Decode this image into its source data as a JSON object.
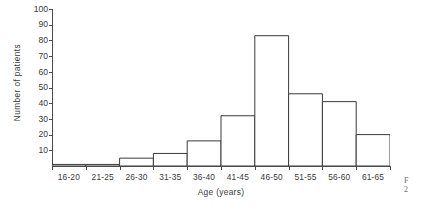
{
  "chart_data": {
    "type": "bar",
    "title": "",
    "subtitle": "",
    "xlabel": "Age (years)",
    "ylabel": "Number of patients",
    "categories": [
      "16-20",
      "21-25",
      "26-30",
      "31-35",
      "36-40",
      "41-45",
      "46-50",
      "51-55",
      "56-60",
      "61-65"
    ],
    "values": [
      1,
      1,
      5,
      8,
      16,
      32,
      83,
      46,
      41,
      20
    ],
    "series": [
      {
        "name": "Number of patients",
        "values": [
          1,
          1,
          5,
          8,
          16,
          32,
          83,
          46,
          41,
          20
        ]
      }
    ],
    "ylim": [
      0,
      100
    ],
    "ytick_values": [
      10,
      20,
      30,
      40,
      50,
      60,
      70,
      80,
      90,
      100
    ],
    "ytick_labels": [
      "10",
      "20",
      "30",
      "40",
      "50",
      "60",
      "70",
      "80",
      "90",
      "100"
    ],
    "xtick_labels": [
      "16-20",
      "21-25",
      "26-30",
      "31-35",
      "36-40",
      "41-45",
      "46-50",
      "51-55",
      "56-60",
      "61-65"
    ],
    "grid": false,
    "legend": false,
    "legend_position": "none",
    "bar_style": "outlined",
    "bar_fill": "#ffffff",
    "bar_stroke": "#3a3a3a",
    "axis_color": "#4a4a4a",
    "background": "#ffffff",
    "annotations": []
  },
  "caption": {
    "line1": "F",
    "line2": "2"
  }
}
